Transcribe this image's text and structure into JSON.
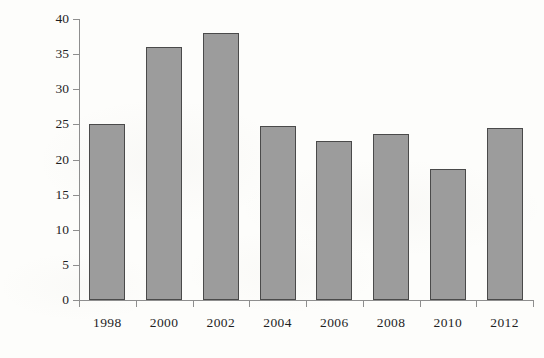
{
  "chart_data": {
    "type": "bar",
    "title": "",
    "xlabel": "",
    "ylabel": "number of participants",
    "categories": [
      "1998",
      "2000",
      "2002",
      "2004",
      "2006",
      "2008",
      "2010",
      "2012"
    ],
    "values": [
      25.0,
      36.0,
      38.0,
      24.8,
      22.7,
      23.6,
      18.6,
      24.5
    ],
    "ylim": [
      0,
      40
    ],
    "yticks": [
      0,
      5,
      10,
      15,
      20,
      25,
      30,
      35,
      40
    ],
    "ytick_labels": [
      "0",
      "5",
      "10",
      "15",
      "20",
      "25",
      "30",
      "35",
      "40"
    ],
    "grid": false,
    "legend": null,
    "colors": {
      "bar_fill": "#9c9c9c",
      "bar_border": "#4a4a4a",
      "axis": "#8e8e8e",
      "text": "#1f1f1f",
      "background": "#fdfdfb"
    }
  }
}
